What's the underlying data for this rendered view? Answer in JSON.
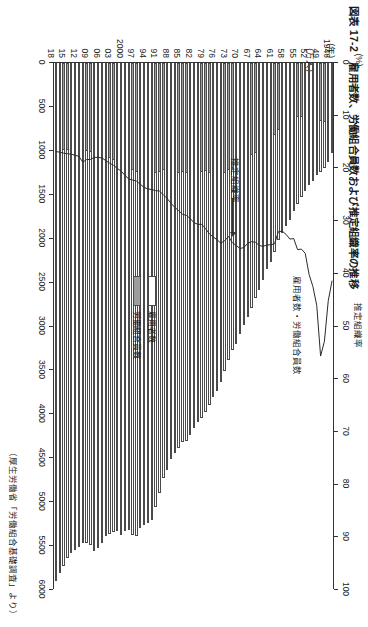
{
  "figure": {
    "number": "図表 17-2",
    "title": "図表 17-2　雇用者数、労働組合員数および推定組織率の推移",
    "source": "（厚生労働省「労働組合基礎調査」より）"
  },
  "axes": {
    "percent_unit": "(%)",
    "percent_name": "推定組織率",
    "percent_ticks": [
      "0",
      "10",
      "20",
      "30",
      "40",
      "50",
      "60",
      "70",
      "80",
      "90",
      "100"
    ],
    "percent_min": 0,
    "percent_max": 100,
    "count_unit": "(万人)",
    "count_name": "雇用者数・労働組合員数",
    "count_ticks": [
      "0",
      "500",
      "1000",
      "1500",
      "2000",
      "2500",
      "3000",
      "3500",
      "4000",
      "4500",
      "5000",
      "5500",
      "6000"
    ],
    "count_min": 0,
    "count_max": 6000,
    "year_unit": "(年)"
  },
  "legend": {
    "position": "center",
    "items": [
      {
        "label": "雇用者数",
        "swatch": "white",
        "color": "#ffffff"
      },
      {
        "label": "労働組合員数",
        "swatch": "gray",
        "color": "#9d9d9d"
      }
    ]
  },
  "annotation": {
    "label": "推定組織率"
  },
  "chart_data": {
    "type": "bar",
    "title": "雇用者数、労働組合員数および推定組織率の推移",
    "subtitle": "",
    "xlabel": "(年)",
    "ylabel": "雇用者数・労働組合員数 (万人)",
    "y2label": "推定組織率 (%)",
    "ylim": [
      0,
      6000
    ],
    "y2lim": [
      0,
      100
    ],
    "grid": false,
    "legend_position": "center",
    "orientation": "horizontal-bars-rotated",
    "categories": [
      "1946",
      "1947",
      "1948",
      "1949",
      "1950",
      "1951",
      "1952",
      "1953",
      "1954",
      "1955",
      "1956",
      "1957",
      "1958",
      "1959",
      "1960",
      "1961",
      "1962",
      "1963",
      "1964",
      "1965",
      "1966",
      "1967",
      "1968",
      "1969",
      "1970",
      "1971",
      "1972",
      "1973",
      "1974",
      "1975",
      "1976",
      "1977",
      "1978",
      "1979",
      "1980",
      "1981",
      "1982",
      "1983",
      "1984",
      "1985",
      "1986",
      "1987",
      "1988",
      "1989",
      "1990",
      "1991",
      "1992",
      "1993",
      "1994",
      "1995",
      "1996",
      "1997",
      "1998",
      "1999",
      "2000",
      "2001",
      "2002",
      "2003",
      "2004",
      "2005",
      "2006",
      "2007",
      "2008",
      "2009",
      "2010",
      "2011",
      "2012",
      "2013",
      "2014",
      "2015",
      "2016",
      "2017",
      "2018"
    ],
    "tick_labels": [
      "1946",
      "49",
      "52",
      "55",
      "58",
      "61",
      "64",
      "67",
      "70",
      "73",
      "76",
      "79",
      "82",
      "85",
      "88",
      "91",
      "94",
      "97",
      "2000",
      "03",
      "06",
      "09",
      "12",
      "15",
      "18"
    ],
    "series": [
      {
        "name": "雇用者数",
        "unit": "万人",
        "color": "#ffffff",
        "values": [
          1020,
          1130,
          1190,
          1240,
          1270,
          1340,
          1390,
          1460,
          1530,
          1610,
          1690,
          1790,
          1860,
          1930,
          2020,
          2150,
          2260,
          2350,
          2470,
          2580,
          2680,
          2790,
          2890,
          2980,
          3090,
          3200,
          3270,
          3380,
          3510,
          3630,
          3730,
          3800,
          3890,
          3970,
          4040,
          4090,
          4160,
          4240,
          4300,
          4310,
          4380,
          4440,
          4510,
          4630,
          4730,
          4900,
          5060,
          5200,
          5240,
          5260,
          5290,
          5390,
          5370,
          5320,
          5330,
          5370,
          5330,
          5340,
          5360,
          5390,
          5470,
          5520,
          5560,
          5490,
          5460,
          5470,
          5510,
          5540,
          5580,
          5640,
          5730,
          5810,
          5900
        ],
        "min_value": 1020,
        "max_value": 5900
      },
      {
        "name": "労働組合員数",
        "unit": "万人",
        "color": "#9d9d9d",
        "values": [
          368,
          560,
          670,
          665,
          578,
          568,
          580,
          595,
          610,
          618,
          643,
          672,
          690,
          710,
          760,
          817,
          871,
          909,
          950,
          1010,
          1030,
          1050,
          1090,
          1110,
          1160,
          1180,
          1190,
          1220,
          1250,
          1260,
          1250,
          1250,
          1250,
          1230,
          1240,
          1250,
          1250,
          1250,
          1250,
          1240,
          1250,
          1250,
          1250,
          1230,
          1220,
          1240,
          1250,
          1250,
          1240,
          1260,
          1250,
          1240,
          1220,
          1200,
          1170,
          1150,
          1120,
          1100,
          1080,
          1070,
          1010,
          1010,
          1010,
          1010,
          1000,
          996,
          989,
          987,
          985,
          988,
          994,
          998,
          1007
        ],
        "min_value": 368,
        "max_value": 1260
      },
      {
        "name": "推定組織率",
        "unit": "%",
        "color": "#333333",
        "axis": "secondary",
        "values": [
          41.5,
          45.3,
          53.0,
          55.8,
          46.2,
          42.6,
          40.3,
          36.3,
          35.5,
          35.6,
          33.5,
          33.6,
          32.7,
          32.1,
          32.2,
          34.5,
          34.7,
          34.7,
          35.0,
          34.8,
          34.2,
          34.1,
          34.4,
          35.2,
          35.4,
          34.8,
          34.3,
          33.1,
          33.9,
          34.4,
          33.7,
          33.2,
          32.6,
          31.6,
          30.8,
          30.8,
          30.5,
          29.7,
          29.1,
          28.9,
          28.2,
          27.6,
          26.8,
          25.9,
          25.2,
          24.5,
          24.4,
          24.2,
          24.1,
          23.8,
          23.2,
          22.6,
          22.4,
          22.2,
          21.5,
          20.7,
          20.2,
          19.6,
          19.2,
          18.7,
          18.2,
          18.1,
          18.1,
          18.5,
          18.5,
          19.0,
          17.9,
          17.7,
          17.5,
          17.4,
          17.3,
          17.1,
          17.0
        ],
        "min_value": 17.0,
        "max_value": 55.8
      }
    ]
  }
}
